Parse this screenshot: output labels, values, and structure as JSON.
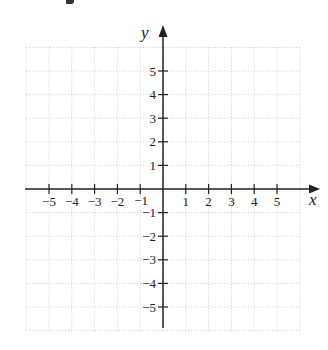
{
  "figure": {
    "title_fragment": "y",
    "x_axis_label": "x",
    "y_axis_label": "y",
    "x_ticks": [
      -5,
      -4,
      -3,
      -2,
      -1,
      1,
      2,
      3,
      4,
      5
    ],
    "y_ticks": [
      5,
      4,
      3,
      2,
      1,
      -1,
      -2,
      -3,
      -4,
      -5
    ],
    "x_tick_labels": [
      "−5",
      "−4",
      "−3",
      "−2",
      "−1",
      "1",
      "2",
      "3",
      "4",
      "5"
    ],
    "y_tick_labels": [
      "5",
      "4",
      "3",
      "2",
      "1",
      "−1",
      "−2",
      "−3",
      "−4",
      "−5"
    ],
    "grid": {
      "style": "dotted",
      "cells_x": 12,
      "cells_y": 12,
      "color": "#bbbbbb"
    },
    "axis_color": "#222222"
  },
  "chart_data": {
    "type": "scatter",
    "title": "",
    "xlabel": "x",
    "ylabel": "y",
    "xlim": [
      -6,
      6
    ],
    "ylim": [
      -6,
      6
    ],
    "grid": true,
    "series": [],
    "x_ticks": [
      -5,
      -4,
      -3,
      -2,
      -1,
      1,
      2,
      3,
      4,
      5
    ],
    "y_ticks": [
      -5,
      -4,
      -3,
      -2,
      -1,
      1,
      2,
      3,
      4,
      5
    ]
  }
}
